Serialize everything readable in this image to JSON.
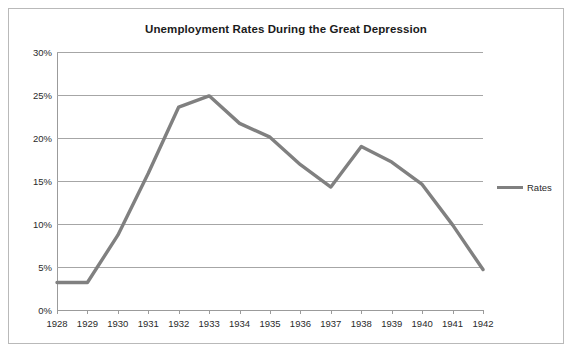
{
  "chart_data": {
    "type": "line",
    "title": "Unemployment Rates During the Great Depression",
    "xlabel": "",
    "ylabel": "",
    "categories": [
      "1928",
      "1929",
      "1930",
      "1931",
      "1932",
      "1933",
      "1934",
      "1935",
      "1936",
      "1937",
      "1938",
      "1939",
      "1940",
      "1941",
      "1942"
    ],
    "series": [
      {
        "name": "Rates",
        "color": "#808080",
        "values": [
          3.2,
          3.2,
          8.7,
          15.9,
          23.6,
          24.9,
          21.7,
          20.1,
          16.9,
          14.3,
          19.0,
          17.2,
          14.6,
          9.9,
          4.7
        ]
      }
    ],
    "ylim": [
      0,
      30
    ],
    "ytick_labels": [
      "30%",
      "25%",
      "20%",
      "15%",
      "10%",
      "5%",
      "0%"
    ],
    "ytick_values": [
      30,
      25,
      20,
      15,
      10,
      5,
      0
    ],
    "grid": true,
    "legend_position": "right",
    "legend_entries": [
      "Rates"
    ]
  },
  "legend": {
    "rates_label": "Rates"
  },
  "colors": {
    "series_line": "#808080",
    "gridline": "#a6a6a6",
    "axis": "#9b9b9b",
    "frame": "#b9b9b9",
    "text": "#2a2a2a",
    "title_text": "#1b1b1b",
    "background": "#ffffff"
  }
}
